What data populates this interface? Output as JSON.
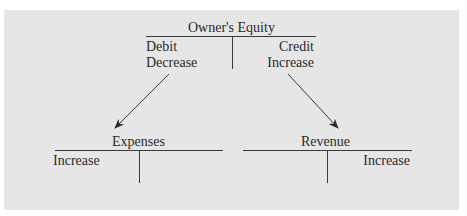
{
  "owners_equity": {
    "title": "Owner's Equity",
    "left_line1": "Debit",
    "left_line2": "Decrease",
    "right_line1": "Credit",
    "right_line2": "Increase"
  },
  "expenses": {
    "title": "Expenses",
    "left_label": "Increase"
  },
  "revenue": {
    "title": "Revenue",
    "right_label": "Increase"
  },
  "colors": {
    "panel": "#e6e6e6",
    "ink": "#2a2a2a"
  }
}
